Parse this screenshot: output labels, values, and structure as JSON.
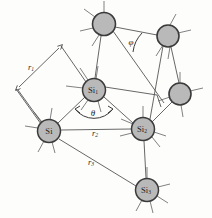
{
  "figure": {
    "background_color": "#fdfdfc",
    "atom_fill_color": "#b9b9b9",
    "atom_stroke_color": "#3a3a3a",
    "bond_color": "#565656"
  },
  "atoms": [
    {
      "id": "si-top-left",
      "label": "",
      "subscript": "",
      "cx": 104,
      "cy": 24,
      "r": 11.5,
      "labeled": false
    },
    {
      "id": "si-top-right",
      "label": "",
      "subscript": "",
      "cx": 168,
      "cy": 36,
      "r": 11,
      "labeled": false
    },
    {
      "id": "si-right",
      "label": "",
      "subscript": "",
      "cx": 180,
      "cy": 94,
      "r": 11,
      "labeled": false
    },
    {
      "id": "si-center",
      "label": "Si",
      "subscript": "1",
      "cx": 94,
      "cy": 90,
      "r": 11.5,
      "labeled": true
    },
    {
      "id": "si-left",
      "label": "Si",
      "subscript": "",
      "cx": 49,
      "cy": 131,
      "r": 11.5,
      "labeled": true
    },
    {
      "id": "si-mid-right",
      "label": "Si",
      "subscript": "2",
      "cx": 143,
      "cy": 129,
      "r": 11.5,
      "labeled": true
    },
    {
      "id": "si-bottom",
      "label": "Si",
      "subscript": "3",
      "cx": 147,
      "cy": 190,
      "r": 11.5,
      "labeled": true
    }
  ],
  "distance_labels": [
    {
      "id": "r1",
      "base": "r",
      "subscript": "1",
      "x": 31,
      "y": 67,
      "rotation": 0,
      "description": "bond distance between Si and Si1, shown as double-headed measurement arrow"
    },
    {
      "id": "r2",
      "base": "r",
      "subscript": "2",
      "x": 95,
      "y": 133,
      "rotation": 0,
      "description": "distance between Si and Si2"
    },
    {
      "id": "r3",
      "base": "r",
      "subscript": "3",
      "x": 91,
      "y": 162,
      "rotation": 0,
      "description": "distance between Si and Si3"
    }
  ],
  "angle_labels": [
    {
      "id": "theta",
      "symbol": "θ",
      "x": 93,
      "y": 112,
      "description": "bond angle at Si1 between Si and Si2"
    },
    {
      "id": "phi",
      "symbol": "φ",
      "x": 131,
      "y": 42,
      "description": "dihedral / torsion angle at top-left atom"
    }
  ]
}
